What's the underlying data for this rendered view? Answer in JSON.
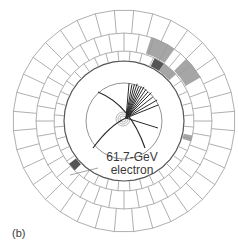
{
  "diagram": {
    "panel_label": "(b)",
    "annotation": {
      "energy": "61.7-GeV",
      "particle": "electron"
    },
    "geometry": {
      "center": [
        124,
        121
      ],
      "ring_radii": [
        60,
        70,
        88,
        111
      ],
      "tracker_radius": 38,
      "vertex": [
        126,
        118
      ],
      "segments": 36
    },
    "colors": {
      "grid": "#9a9a9a",
      "track": "#2a2a2a",
      "deposit_dark": "#555555",
      "deposit_light": "#a6a6a6"
    },
    "deposits": [
      {
        "ring": 1,
        "a0": -64,
        "a1": -55,
        "shade": "dark"
      },
      {
        "ring": 1,
        "a0": -55,
        "a1": -42,
        "shade": "light"
      },
      {
        "ring": 2,
        "a0": -72,
        "a1": -55,
        "shade": "light"
      },
      {
        "ring": 2,
        "a0": -45,
        "a1": -30,
        "shade": "light"
      },
      {
        "ring": 1,
        "a0": 12,
        "a1": 17,
        "shade": "light"
      },
      {
        "ring": 1,
        "a0": 135,
        "a1": 142,
        "shade": "dark"
      }
    ]
  }
}
